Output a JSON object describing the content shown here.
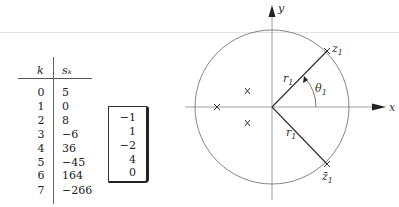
{
  "table": {
    "headers": {
      "k": "k",
      "s": "sₖ"
    },
    "rows": [
      {
        "k": "0",
        "s": "5"
      },
      {
        "k": "1",
        "s": "0"
      },
      {
        "k": "2",
        "s": "8"
      },
      {
        "k": "3",
        "s": "−6"
      },
      {
        "k": "4",
        "s": "36"
      },
      {
        "k": "5",
        "s": "−45"
      },
      {
        "k": "6",
        "s": "164"
      },
      {
        "k": "7",
        "s": "−266"
      }
    ]
  },
  "vector": {
    "values": [
      "−1",
      "1",
      "−2",
      "4",
      "0"
    ]
  },
  "diagram": {
    "axis_x_label": "x",
    "axis_y_label": "y",
    "point_top_label": "z",
    "point_top_sub": "1",
    "point_bottom_label": "z̄",
    "point_bottom_sub": "1",
    "radius_label": "r",
    "radius_sub": "1",
    "angle_label": "θ",
    "angle_sub": "1",
    "interior_markers": [
      "X",
      "X",
      "X"
    ]
  }
}
